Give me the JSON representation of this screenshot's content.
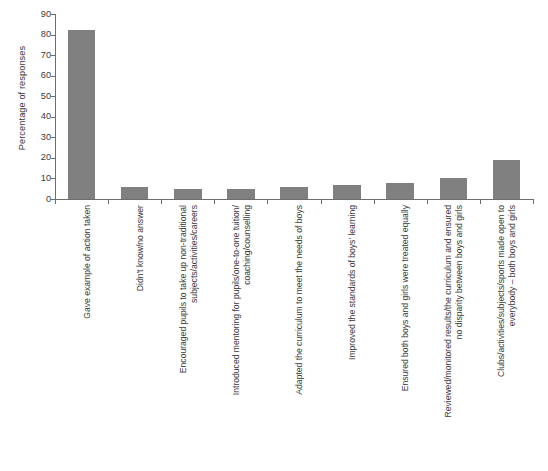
{
  "chart_data": {
    "type": "bar",
    "title": "",
    "xlabel": "",
    "ylabel": "Percentage of responses",
    "ylim": [
      0,
      90
    ],
    "ytick_step": 10,
    "yticks": [
      0,
      10,
      20,
      30,
      40,
      50,
      60,
      70,
      80,
      90
    ],
    "grid": false,
    "legend": "none",
    "bar_color": "#808080",
    "axis_color": "#6e6e6e",
    "categories": [
      "Gave example of action taken",
      "Didn't know/no answer",
      "Encouraged pupils to take up non-traditional subjects/activities/careers",
      "Introduced mentoring for pupils/one-to-one tuition/ coaching/counselling",
      "Adapted the curriculum to meet the needs of boys",
      "Improved the standards of boys' learning",
      "Ensured both boys and girls were treated equally",
      "Reviewed/monitored results/the curriculum and ensured no disparity between boys and girls",
      "Clubs/activities/subjects/sports made open to everybody – both boys and girls"
    ],
    "category_lines": [
      [
        "Gave example of action taken"
      ],
      [
        "Didn't know/no answer"
      ],
      [
        "Encouraged pupils to take up non-traditional",
        "subjects/activities/careers"
      ],
      [
        "Introduced mentoring for pupils/one-to-one tuition/",
        "coaching/counselling"
      ],
      [
        "Adapted the curriculum to meet the needs of boys"
      ],
      [
        "Improved the standards of boys' learning"
      ],
      [
        "Ensured both boys and girls were treated equally"
      ],
      [
        "Reviewed/monitored results/the curriculum and ensured",
        "no disparity between boys and girls"
      ],
      [
        "Clubs/activities/subjects/sports made open to",
        "everybody – both boys and girls"
      ]
    ],
    "values": [
      82,
      6,
      5,
      5,
      6,
      7,
      8,
      10,
      19
    ]
  }
}
